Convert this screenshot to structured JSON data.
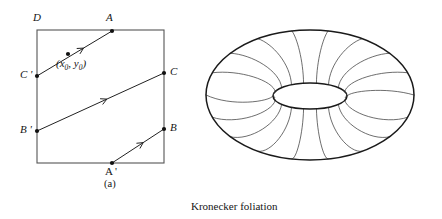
{
  "figure": {
    "caption": "Kronecker foliation",
    "subcaption_a": "(a)",
    "subcaption_b": "(b)",
    "line_color": "#222222",
    "square_color": "#555555",
    "torus_color": "#1a1a1a",
    "curve_color": "#333333",
    "background": "#ffffff"
  },
  "panel_a": {
    "name": "fundamental-square-with-flow-lines",
    "square": {
      "left": 37,
      "top": 30,
      "right": 164,
      "bottom": 163
    },
    "labels": [
      {
        "id": "D",
        "text": "D",
        "x": 33,
        "y": 12,
        "italic": true
      },
      {
        "id": "A",
        "text": "A",
        "x": 106,
        "y": 12,
        "italic": true
      },
      {
        "id": "C",
        "text": "C",
        "x": 170,
        "y": 66,
        "italic": true
      },
      {
        "id": "B",
        "text": "B",
        "x": 170,
        "y": 122,
        "italic": true
      },
      {
        "id": "Cp",
        "text": "C '",
        "x": 20,
        "y": 69,
        "italic": true
      },
      {
        "id": "Bp",
        "text": "B '",
        "x": 20,
        "y": 124,
        "italic": true
      },
      {
        "id": "Ap",
        "text": "A '",
        "x": 105,
        "y": 166,
        "italic": true
      }
    ],
    "coordinate_label": {
      "id": "x0y0",
      "x": 56,
      "y": 58,
      "open_paren": "(",
      "x_sym": "x",
      "x_sub": "0",
      "comma": ", ",
      "y_sym": "y",
      "y_sub": "0",
      "close_paren": ")"
    },
    "points": [
      {
        "id": "A",
        "x": 112,
        "y": 31
      },
      {
        "id": "mid-seg",
        "x": 68,
        "y": 54
      },
      {
        "id": "Cp",
        "x": 37,
        "y": 76
      },
      {
        "id": "C",
        "x": 164,
        "y": 73
      },
      {
        "id": "Bp",
        "x": 37,
        "y": 131
      },
      {
        "id": "B",
        "x": 164,
        "y": 129
      },
      {
        "id": "Ap",
        "x": 112,
        "y": 163
      }
    ],
    "flow_lines": [
      {
        "id": "line-Cp-A",
        "x1": 37,
        "y1": 76,
        "x2": 112,
        "y2": 31,
        "arrow_t": 0.62
      },
      {
        "id": "line-Bp-C",
        "x1": 37,
        "y1": 131,
        "x2": 164,
        "y2": 73,
        "arrow_t": 0.55
      },
      {
        "id": "line-Ap-B",
        "x1": 112,
        "y1": 163,
        "x2": 164,
        "y2": 129,
        "arrow_t": 0.6
      }
    ]
  },
  "panel_b": {
    "name": "torus-with-foliation-curves",
    "outer_ellipse": {
      "cx": 110,
      "cy": 95,
      "rx": 104,
      "ry": 65
    },
    "inner_hole": {
      "cx": 110,
      "cy": 96,
      "rx": 37,
      "ry": 13
    },
    "meridian_count": 18
  }
}
